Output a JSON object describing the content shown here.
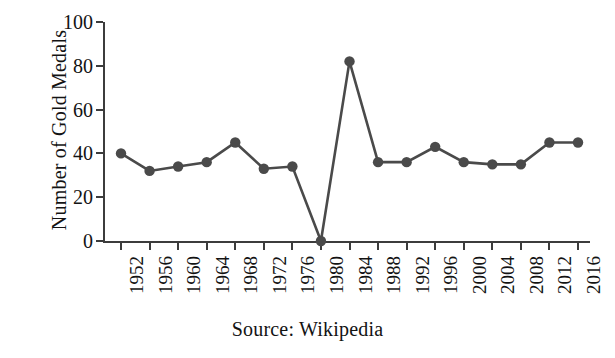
{
  "chart_data": {
    "type": "line",
    "title": "",
    "subtitle": "",
    "xlabel": "",
    "ylabel": "Number of Gold Medals",
    "categories": [
      "1952",
      "1956",
      "1960",
      "1964",
      "1968",
      "1972",
      "1976",
      "1980",
      "1984",
      "1988",
      "1992",
      "1996",
      "2000",
      "2004",
      "2008",
      "2012",
      "2016"
    ],
    "values": [
      40,
      32,
      34,
      36,
      45,
      33,
      34,
      0,
      82,
      36,
      36,
      43,
      36,
      35,
      35,
      45,
      45
    ],
    "series": [
      {
        "name": "Number of Gold Medals",
        "values": [
          40,
          32,
          34,
          36,
          45,
          33,
          34,
          0,
          82,
          36,
          36,
          43,
          36,
          35,
          35,
          45,
          45
        ]
      }
    ],
    "ylim": [
      0,
      100
    ],
    "ytick_labels": [
      "0",
      "20",
      "40",
      "60",
      "80",
      "100"
    ],
    "ytick_values": [
      0,
      20,
      40,
      60,
      80,
      100
    ],
    "xtick_labels": [
      "1952",
      "1956",
      "1960",
      "1964",
      "1968",
      "1972",
      "1976",
      "1980",
      "1984",
      "1988",
      "1992",
      "1996",
      "2000",
      "2004",
      "2008",
      "2012",
      "2016"
    ],
    "grid": false,
    "legend": "none",
    "annotations": [],
    "marker": "filled-circle",
    "line_color": "#4a4a4a",
    "marker_color": "#4a4a4a",
    "axis_color": "#3c3c3c",
    "background_color": "#ffffff"
  },
  "caption": {
    "source_text": "Source: Wikipedia"
  },
  "axis": {
    "y_title": "Number of Gold Medals"
  }
}
